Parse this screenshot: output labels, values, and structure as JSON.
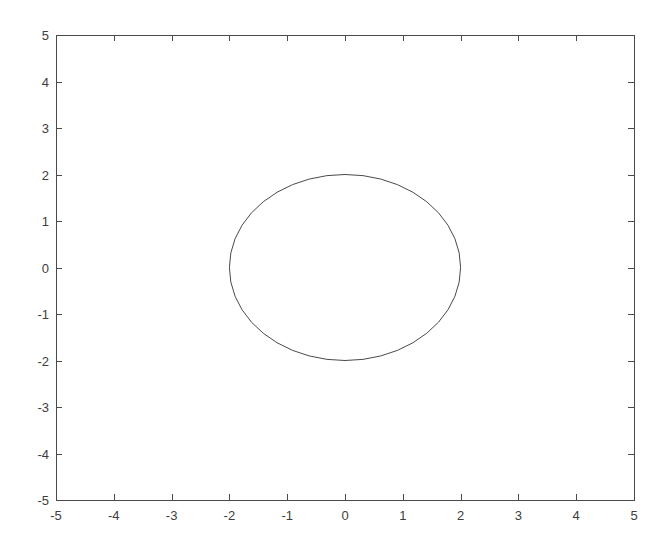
{
  "figure": {
    "background_color": "#ffffff",
    "axes_color": "#4a4a4a",
    "label_color": "#3d3d3d",
    "curve_color": "#4a4a4a"
  },
  "chart_data": {
    "type": "line",
    "title": "",
    "xlabel": "",
    "ylabel": "",
    "xlim": [
      -5,
      5
    ],
    "ylim": [
      -5,
      5
    ],
    "grid": false,
    "legend": null,
    "box": true,
    "tick_direction": "in",
    "aspect": "auto",
    "xticks": [
      -5,
      -4,
      -3,
      -2,
      -1,
      0,
      1,
      2,
      3,
      4,
      5
    ],
    "xticklabels": [
      "-5",
      "-4",
      "-3",
      "-2",
      "-1",
      "0",
      "1",
      "2",
      "3",
      "4",
      "5"
    ],
    "yticks": [
      -5,
      -4,
      -3,
      -2,
      -1,
      0,
      1,
      2,
      3,
      4,
      5
    ],
    "yticklabels": [
      "-5",
      "-4",
      "-3",
      "-2",
      "-1",
      "0",
      "1",
      "2",
      "3",
      "4",
      "5"
    ],
    "series": [
      {
        "name": "circle-radius-2",
        "shape": "circle",
        "center": [
          0,
          0
        ],
        "radius": 2,
        "closed": true,
        "linewidth": 1,
        "color": "#4a4a4a",
        "x": [
          2,
          1.9754,
          1.9021,
          1.782,
          1.618,
          1.4142,
          1.1756,
          0.9079,
          0.618,
          0.3129,
          0,
          -0.3129,
          -0.618,
          -0.9079,
          -1.1756,
          -1.4142,
          -1.618,
          -1.782,
          -1.9021,
          -1.9754,
          -2,
          -1.9754,
          -1.9021,
          -1.782,
          -1.618,
          -1.4142,
          -1.1756,
          -0.9079,
          -0.618,
          -0.3129,
          0,
          0.3129,
          0.618,
          0.9079,
          1.1756,
          1.4142,
          1.618,
          1.782,
          1.9021,
          1.9754,
          2
        ],
        "y": [
          0,
          0.3129,
          0.618,
          0.9079,
          1.1756,
          1.4142,
          1.618,
          1.782,
          1.9021,
          1.9754,
          2,
          1.9754,
          1.9021,
          1.782,
          1.618,
          1.4142,
          1.1756,
          0.9079,
          0.618,
          0.3129,
          0,
          -0.3129,
          -0.618,
          -0.9079,
          -1.1756,
          -1.4142,
          -1.618,
          -1.782,
          -1.9021,
          -1.9754,
          -2,
          -1.9754,
          -1.9021,
          -1.782,
          -1.618,
          -1.4142,
          -1.1756,
          -0.9079,
          -0.618,
          -0.3129,
          0
        ]
      }
    ]
  },
  "axes_geometry": {
    "left_px": 56,
    "right_px": 634,
    "top_px": 35,
    "bottom_px": 500,
    "tick_length_px": 6
  }
}
